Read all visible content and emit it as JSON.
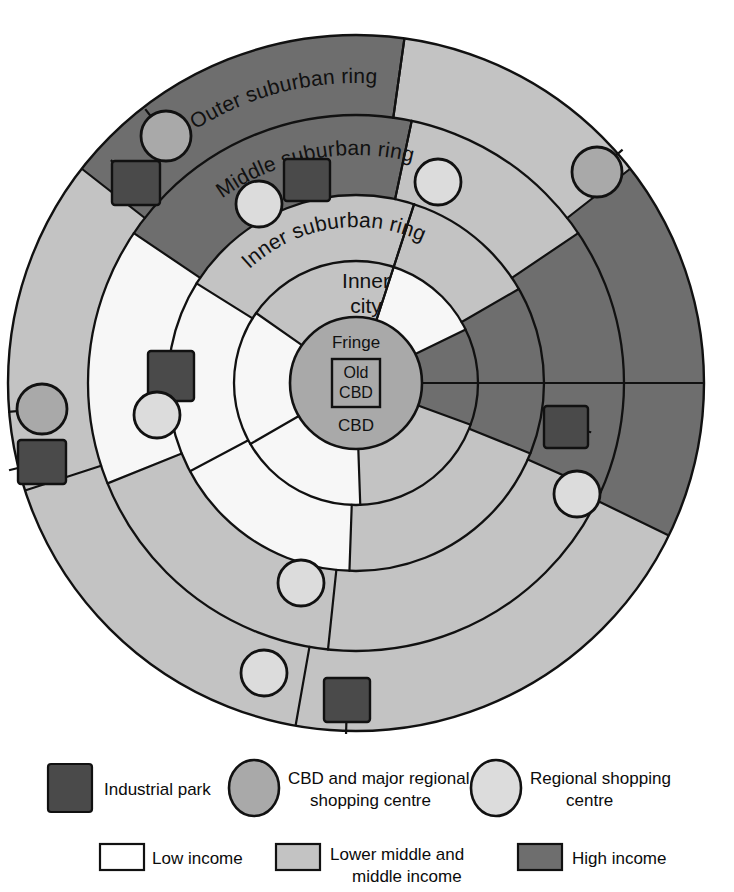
{
  "diagram": {
    "center": {
      "x": 356,
      "y": 383
    },
    "outer_radius": 348,
    "ring_labels": [
      {
        "key": "outer_suburban",
        "text": "Outer suburban ring"
      },
      {
        "key": "middle_suburban",
        "text": "Middle suburban ring"
      },
      {
        "key": "inner_suburban",
        "text": "Inner suburban ring"
      }
    ],
    "zone_labels": [
      {
        "key": "inner_city",
        "line1": "Inner",
        "line2": "city"
      },
      {
        "key": "fringe",
        "text": "Fringe"
      },
      {
        "key": "cbd",
        "text": "CBD"
      },
      {
        "key": "old_cbd",
        "line1": "Old",
        "line2": "CBD"
      }
    ],
    "rings": [
      {
        "name": "old-cbd",
        "inner_radius": 0,
        "outer_radius": 24
      },
      {
        "name": "cbd-fringe",
        "inner_radius": 0,
        "outer_radius": 66
      },
      {
        "name": "inner-city",
        "inner_radius": 66,
        "outer_radius": 122
      },
      {
        "name": "inner-suburban-ring",
        "inner_radius": 122,
        "outer_radius": 188
      },
      {
        "name": "middle-suburban-ring",
        "inner_radius": 188,
        "outer_radius": 268
      },
      {
        "name": "outer-suburban-ring",
        "inner_radius": 268,
        "outer_radius": 348
      }
    ],
    "colors": {
      "low_income": "#f7f7f7",
      "middle_income": "#c3c3c3",
      "high_income": "#6e6e6e",
      "cbd_circle": "#a9a9a9",
      "industrial_park": "#4a4a4a",
      "cbd_major_centre": "#a9a9a9",
      "regional_centre": "#dcdcdc",
      "outline": "#111111",
      "background": "#ffffff"
    },
    "sectors": [
      {
        "ring": "inner-city",
        "start_deg": -72,
        "end_deg": -26,
        "income": "low_income"
      },
      {
        "ring": "inner-city",
        "start_deg": -26,
        "end_deg": 20,
        "income": "high_income"
      },
      {
        "ring": "inner-city",
        "start_deg": 20,
        "end_deg": 88,
        "income": "middle_income"
      },
      {
        "ring": "inner-city",
        "start_deg": 88,
        "end_deg": 150,
        "income": "low_income"
      },
      {
        "ring": "inner-city",
        "start_deg": 150,
        "end_deg": 215,
        "income": "low_income"
      },
      {
        "ring": "inner-city",
        "start_deg": 215,
        "end_deg": 288,
        "income": "middle_income"
      },
      {
        "ring": "inner-suburban-ring",
        "start_deg": -72,
        "end_deg": -30,
        "income": "middle_income"
      },
      {
        "ring": "inner-suburban-ring",
        "start_deg": -30,
        "end_deg": 22,
        "income": "high_income"
      },
      {
        "ring": "inner-suburban-ring",
        "start_deg": 22,
        "end_deg": 92,
        "income": "middle_income"
      },
      {
        "ring": "inner-suburban-ring",
        "start_deg": 92,
        "end_deg": 152,
        "income": "low_income"
      },
      {
        "ring": "inner-suburban-ring",
        "start_deg": 152,
        "end_deg": 212,
        "income": "low_income"
      },
      {
        "ring": "inner-suburban-ring",
        "start_deg": 212,
        "end_deg": 288,
        "income": "middle_income"
      },
      {
        "ring": "middle-suburban-ring",
        "start_deg": -78,
        "end_deg": -34,
        "income": "middle_income"
      },
      {
        "ring": "middle-suburban-ring",
        "start_deg": -34,
        "end_deg": 24,
        "income": "high_income"
      },
      {
        "ring": "middle-suburban-ring",
        "start_deg": 24,
        "end_deg": 96,
        "income": "middle_income"
      },
      {
        "ring": "middle-suburban-ring",
        "start_deg": 96,
        "end_deg": 158,
        "income": "middle_income"
      },
      {
        "ring": "middle-suburban-ring",
        "start_deg": 158,
        "end_deg": 214,
        "income": "low_income"
      },
      {
        "ring": "middle-suburban-ring",
        "start_deg": 214,
        "end_deg": 282,
        "income": "high_income"
      },
      {
        "ring": "outer-suburban-ring",
        "start_deg": -82,
        "end_deg": -38,
        "income": "middle_income"
      },
      {
        "ring": "outer-suburban-ring",
        "start_deg": -38,
        "end_deg": 26,
        "income": "high_income"
      },
      {
        "ring": "outer-suburban-ring",
        "start_deg": 26,
        "end_deg": 100,
        "income": "middle_income"
      },
      {
        "ring": "outer-suburban-ring",
        "start_deg": 100,
        "end_deg": 162,
        "income": "middle_income"
      },
      {
        "ring": "outer-suburban-ring",
        "start_deg": 162,
        "end_deg": 218,
        "income": "middle_income"
      },
      {
        "ring": "outer-suburban-ring",
        "start_deg": 218,
        "end_deg": 278,
        "income": "high_income"
      }
    ],
    "markers": {
      "cbd_major_centres": [
        {
          "name": "centre-top-left",
          "x": 166,
          "y": 136,
          "r": 25
        },
        {
          "name": "centre-right",
          "x": 597,
          "y": 172,
          "r": 25
        },
        {
          "name": "centre-left",
          "x": 42,
          "y": 409,
          "r": 25
        }
      ],
      "regional_centres": [
        {
          "name": "centre-inner-top-left",
          "x": 259,
          "y": 204,
          "r": 23
        },
        {
          "name": "centre-inner-top",
          "x": 438,
          "y": 182,
          "r": 23
        },
        {
          "name": "centre-inner-left",
          "x": 157,
          "y": 415,
          "r": 23
        },
        {
          "name": "centre-inner-right",
          "x": 577,
          "y": 494,
          "r": 23
        },
        {
          "name": "centre-inner-bottom",
          "x": 301,
          "y": 583,
          "r": 23
        },
        {
          "name": "centre-outer-bottom",
          "x": 264,
          "y": 673,
          "r": 23
        }
      ],
      "industrial_parks": [
        {
          "name": "park-top-left",
          "x": 136,
          "y": 183,
          "w": 48,
          "h": 44
        },
        {
          "name": "park-top-centre",
          "x": 307,
          "y": 180,
          "w": 46,
          "h": 42
        },
        {
          "name": "park-mid-left",
          "x": 171,
          "y": 376,
          "w": 46,
          "h": 50
        },
        {
          "name": "park-far-left",
          "x": 42,
          "y": 462,
          "w": 48,
          "h": 44
        },
        {
          "name": "park-right",
          "x": 566,
          "y": 427,
          "w": 44,
          "h": 42
        },
        {
          "name": "park-bottom",
          "x": 347,
          "y": 700,
          "w": 46,
          "h": 44
        }
      ]
    }
  },
  "legend": {
    "row1": [
      {
        "key": "industrial_park",
        "symbol": "square",
        "color": "#4a4a4a",
        "label": "Industrial park"
      },
      {
        "key": "cbd_major_centre",
        "symbol": "circle",
        "color": "#a9a9a9",
        "label_line1": "CBD and major regional",
        "label_line2": "shopping centre"
      },
      {
        "key": "regional_centre",
        "symbol": "circle",
        "color": "#dcdcdc",
        "label_line1": "Regional shopping",
        "label_line2": "centre"
      }
    ],
    "row2": [
      {
        "key": "low_income",
        "symbol": "rect",
        "color": "#ffffff",
        "label_line1": "Low income",
        "label_line2": ""
      },
      {
        "key": "middle_income",
        "symbol": "rect",
        "color": "#c3c3c3",
        "label_line1": "Lower middle and",
        "label_line2": "middle income"
      },
      {
        "key": "high_income",
        "symbol": "rect",
        "color": "#6e6e6e",
        "label_line1": "High income",
        "label_line2": ""
      }
    ]
  }
}
